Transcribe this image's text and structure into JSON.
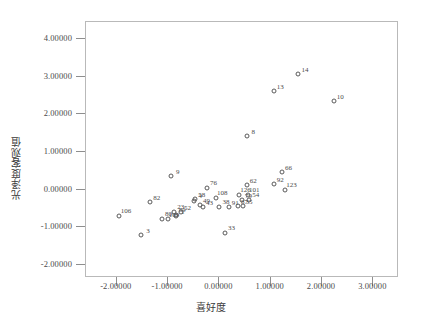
{
  "chart_data": {
    "type": "scatter",
    "title": "",
    "xlabel": "喜好度",
    "ylabel": "光泽度客观值",
    "xlim": [
      -2.6,
      3.5
    ],
    "ylim": [
      -2.35,
      4.45
    ],
    "grid": false,
    "legend": false,
    "xticks": [
      "-2.00000",
      "-1.00000",
      "0.00000",
      "1.00000",
      "2.00000",
      "3.00000"
    ],
    "xtick_values": [
      -2,
      -1,
      0,
      1,
      2,
      3
    ],
    "yticks": [
      "4.00000",
      "3.00000",
      "2.00000",
      "1.00000",
      "0.00000",
      "-1.00000",
      "-2.00000"
    ],
    "ytick_values": [
      4,
      3,
      2,
      1,
      0,
      -1,
      -2
    ],
    "point_label_field": "case number",
    "points": [
      {
        "label": "106",
        "x": -1.93,
        "y": -0.72
      },
      {
        "label": "3",
        "x": -1.5,
        "y": -1.24
      },
      {
        "label": "82",
        "x": -1.33,
        "y": -0.37
      },
      {
        "label": "80",
        "x": -1.1,
        "y": -0.8
      },
      {
        "label": "109",
        "x": -0.99,
        "y": -0.82
      },
      {
        "label": "23",
        "x": -0.86,
        "y": -0.62
      },
      {
        "label": "89",
        "x": -0.83,
        "y": -0.7
      },
      {
        "label": "1",
        "x": -0.82,
        "y": -0.73
      },
      {
        "label": "52",
        "x": -0.73,
        "y": -0.63
      },
      {
        "label": "9",
        "x": -0.92,
        "y": 0.33
      },
      {
        "label": "4",
        "x": -0.48,
        "y": -0.32
      },
      {
        "label": "58",
        "x": -0.45,
        "y": -0.28
      },
      {
        "label": "49",
        "x": -0.36,
        "y": -0.44
      },
      {
        "label": "43",
        "x": -0.3,
        "y": -0.5
      },
      {
        "label": "76",
        "x": -0.22,
        "y": 0.02
      },
      {
        "label": "108",
        "x": -0.05,
        "y": -0.24
      },
      {
        "label": "38",
        "x": 0.02,
        "y": -0.49
      },
      {
        "label": "91",
        "x": 0.2,
        "y": -0.5
      },
      {
        "label": "33",
        "x": 0.13,
        "y": -1.18
      },
      {
        "label": "87",
        "x": 0.38,
        "y": -0.47
      },
      {
        "label": "35",
        "x": 0.47,
        "y": -0.47
      },
      {
        "label": "126",
        "x": 0.4,
        "y": -0.17
      },
      {
        "label": "79",
        "x": 0.46,
        "y": -0.31
      },
      {
        "label": "101",
        "x": 0.57,
        "y": -0.17
      },
      {
        "label": "54",
        "x": 0.6,
        "y": -0.3
      },
      {
        "label": "62",
        "x": 0.55,
        "y": 0.09
      },
      {
        "label": "8",
        "x": 0.55,
        "y": 1.39
      },
      {
        "label": "92",
        "x": 1.08,
        "y": 0.12
      },
      {
        "label": "66",
        "x": 1.24,
        "y": 0.43
      },
      {
        "label": "123",
        "x": 1.3,
        "y": -0.03
      },
      {
        "label": "13",
        "x": 1.08,
        "y": 2.58
      },
      {
        "label": "14",
        "x": 1.56,
        "y": 3.03
      },
      {
        "label": "10",
        "x": 2.25,
        "y": 2.32
      }
    ]
  }
}
